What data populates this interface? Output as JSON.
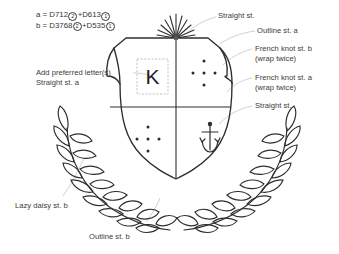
{
  "document": {
    "title": "Embroidery pattern - crest with laurel wreath",
    "background_color": "#ffffff",
    "ink_color": "#3a3a3a",
    "leader_line_color": "#b9b9b9"
  },
  "legend": {
    "lines": [
      {
        "key": "a",
        "eq_sign": "=",
        "thread_1": "D712",
        "strands_1": "2",
        "plus": "+",
        "thread_2": "D613",
        "strands_2": "1"
      },
      {
        "key": "b",
        "eq_sign": "=",
        "thread_1": "D3768",
        "strands_1": "2",
        "plus": "+",
        "thread_2": "D535",
        "strands_2": "1"
      }
    ]
  },
  "annotations": {
    "add_letter": {
      "line1": "Add preferred letter(s)",
      "line2": "Straight st. a"
    },
    "straight_top": {
      "line1": "Straight st."
    },
    "outline_a": {
      "line1": "Outline st. a"
    },
    "french_knot_b": {
      "line1": "French knot st. b",
      "line2": "(wrap twice)"
    },
    "french_knot_a": {
      "line1": "French knot st. a",
      "line2": "(wrap twice)"
    },
    "straight_anchor": {
      "line1": "Straight st."
    },
    "lazy_daisy_b": {
      "line1": "Lazy daisy st. b"
    },
    "outline_b": {
      "line1": "Outline st. b"
    }
  },
  "motifs": {
    "letter_placeholder": "K",
    "letter_box_style": "dashed",
    "quadrant_upper_right_dots": 5,
    "quadrant_lower_left_dots": 5,
    "anchor_icon": "anchor-icon",
    "starburst_rays": 11
  }
}
